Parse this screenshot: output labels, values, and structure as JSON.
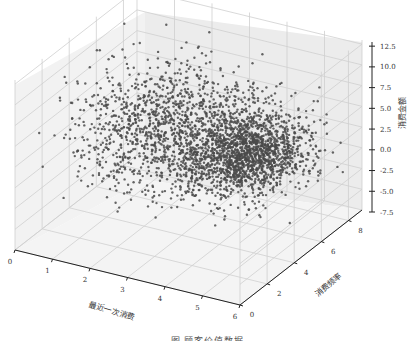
{
  "chart_data": {
    "type": "scatter",
    "dimensions": 3,
    "title": "",
    "xlabel": "最近一次消费",
    "ylabel": "消费频率",
    "zlabel": "消费金额",
    "xlim": [
      0,
      6
    ],
    "ylim": [
      0,
      9
    ],
    "zlim": [
      -7.5,
      13
    ],
    "xticks": [
      "0",
      "1",
      "2",
      "3",
      "4",
      "5",
      "6"
    ],
    "yticks": [
      "0",
      "2",
      "4",
      "6",
      "8"
    ],
    "zticks": [
      "-7.5",
      "-5.0",
      "-2.5",
      "0.0",
      "2.5",
      "5.0",
      "7.5",
      "10.0",
      "12.5"
    ],
    "grid": true,
    "point_color": "#4a4a4a",
    "approx_point_count": 3000,
    "cluster_center": {
      "x": 4.2,
      "y": 5.5,
      "z": 2.0
    }
  },
  "caption": "图  顾客价值数据"
}
